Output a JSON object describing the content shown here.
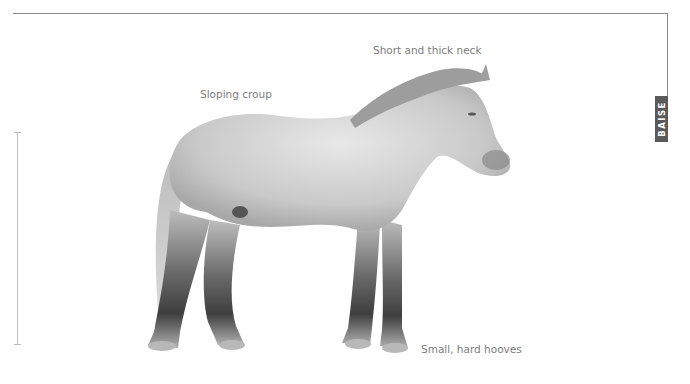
{
  "frame": {
    "line_color": "#8a8a8a"
  },
  "tab": {
    "label": "BAISE",
    "color": "#5a5a5a"
  },
  "scale_bar": {
    "color": "#bcbcbc"
  },
  "annotations": [
    {
      "id": "neck",
      "text": "Short and thick neck"
    },
    {
      "id": "croup",
      "text": "Sloping croup"
    },
    {
      "id": "hooves",
      "text": "Small, hard hooves"
    }
  ],
  "illustration": {
    "subject": "horse-illustration",
    "coat": "dappled grey"
  }
}
